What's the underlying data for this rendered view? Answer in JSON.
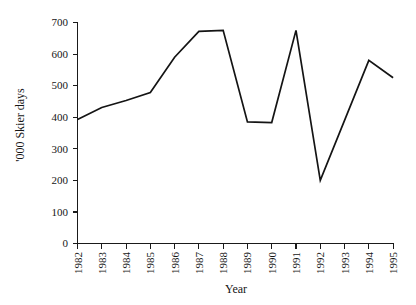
{
  "chart_data": {
    "type": "line",
    "title": "",
    "xlabel": "Year",
    "ylabel": "'000 Skier days",
    "categories": [
      "1982",
      "1983",
      "1984",
      "1985",
      "1986",
      "1987",
      "1988",
      "1989",
      "1990",
      "1991",
      "1992",
      "1993",
      "1994",
      "1995"
    ],
    "x": [
      1982,
      1983,
      1984,
      1985,
      1986,
      1987,
      1988,
      1989,
      1990,
      1991,
      1992,
      1993,
      1994,
      1995
    ],
    "values": [
      393,
      431,
      453,
      478,
      590,
      672,
      675,
      385,
      383,
      675,
      200,
      390,
      580,
      525
    ],
    "series": [
      {
        "name": "Skier days",
        "values": [
          393,
          431,
          453,
          478,
          590,
          672,
          675,
          385,
          383,
          675,
          200,
          390,
          580,
          525
        ]
      }
    ],
    "ylim": [
      0,
      700
    ],
    "yticks": [
      0,
      100,
      200,
      300,
      400,
      500,
      600,
      700
    ],
    "ytick_labels": [
      "0",
      "100",
      "200",
      "300",
      "400",
      "500",
      "600",
      "700"
    ],
    "xtick_labels": [
      "1982",
      "1983",
      "1984",
      "1985",
      "1986",
      "1987",
      "1988",
      "1989",
      "1990",
      "1991",
      "1992",
      "1993",
      "1994",
      "1995"
    ],
    "grid": false,
    "legend": false,
    "legend_position": "none",
    "line_color": "#141414",
    "axis_color": "#1a1a1a",
    "background_color": "#ffffff"
  },
  "axes": {
    "y_title": "'000 Skier days",
    "x_title": "Year"
  }
}
